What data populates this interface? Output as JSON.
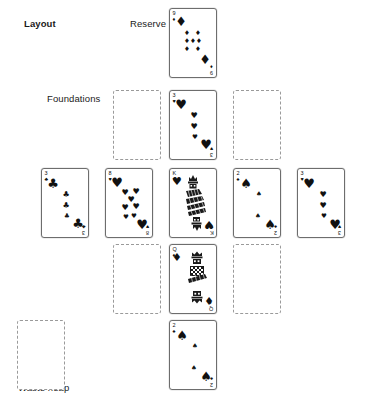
{
  "diagram": {
    "title": "Layout",
    "labels": {
      "layout": "Layout",
      "reserve": "Reserve",
      "foundations": "Foundations",
      "waste_heap": "Waste heap"
    }
  },
  "suits": {
    "spade": "♠",
    "heart": "♥",
    "diamond": "♦",
    "club": "♣"
  },
  "piles": {
    "reserve": {
      "name": "Reserve",
      "card": {
        "rank": "9",
        "suit": "diamond",
        "suit_symbol": "♦",
        "label": "9 of Diamonds"
      }
    },
    "foundations": {
      "name": "Foundations",
      "slots": [
        {
          "state": "empty",
          "label": "Empty foundation"
        },
        {
          "state": "card",
          "rank": "3",
          "suit": "heart",
          "suit_symbol": "♥",
          "label": "3 of Hearts"
        },
        {
          "state": "empty",
          "label": "Empty foundation"
        }
      ]
    },
    "tableau": {
      "name": "Tableau",
      "cards": [
        {
          "rank": "3",
          "suit": "club",
          "suit_symbol": "♣",
          "label": "3 of Clubs"
        },
        {
          "rank": "8",
          "suit": "heart",
          "suit_symbol": "♥",
          "label": "8 of Hearts"
        },
        {
          "rank": "K",
          "suit": "heart",
          "suit_symbol": "♥",
          "label": "King of Hearts",
          "court": true
        },
        {
          "rank": "2",
          "suit": "spade",
          "suit_symbol": "♠",
          "label": "2 of Spades"
        },
        {
          "rank": "3",
          "suit": "heart",
          "suit_symbol": "♥",
          "label": "3 of Hearts"
        }
      ]
    },
    "lower": {
      "slots": [
        {
          "state": "empty",
          "label": "Empty slot"
        },
        {
          "state": "card",
          "rank": "Q",
          "suit": "diamond",
          "suit_symbol": "♦",
          "label": "Queen of Diamonds",
          "court": true
        },
        {
          "state": "empty",
          "label": "Empty slot"
        }
      ]
    },
    "bottom": {
      "card": {
        "rank": "2",
        "suit": "spade",
        "suit_symbol": "♠",
        "label": "2 of Spades"
      }
    },
    "waste": {
      "name": "Waste heap",
      "state": "empty"
    }
  },
  "colors": {
    "card_border": "#6d6d6d",
    "empty_border": "#9a9a9a",
    "ink": "#111111",
    "background": "#ffffff"
  }
}
